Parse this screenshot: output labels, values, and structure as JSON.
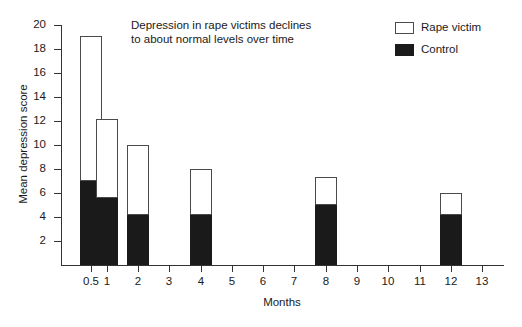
{
  "chart_data": {
    "type": "bar",
    "title": "Depression in rape victims declines to about normal levels over time",
    "title_line1": "Depression in rape victims declines",
    "title_line2": "to about normal levels over time",
    "xlabel": "Months",
    "ylabel": "Mean depression score",
    "stacked": true,
    "grid": false,
    "legend_position": "top-right",
    "xlim": [
      0,
      13
    ],
    "ylim": [
      0,
      20
    ],
    "x_tick_labels": [
      "0.5",
      "1",
      "2",
      "3",
      "4",
      "5",
      "6",
      "7",
      "8",
      "9",
      "10",
      "11",
      "12",
      "13"
    ],
    "x_tick_values": [
      0.5,
      1,
      2,
      3,
      4,
      5,
      6,
      7,
      8,
      9,
      10,
      11,
      12,
      13
    ],
    "y_tick_labels": [
      "2",
      "4",
      "6",
      "8",
      "10",
      "12",
      "14",
      "16",
      "18",
      "20"
    ],
    "y_tick_values": [
      2,
      4,
      6,
      8,
      10,
      12,
      14,
      16,
      18,
      20
    ],
    "categories": [
      "0.5",
      "1",
      "2",
      "4",
      "8",
      "12"
    ],
    "series": [
      {
        "name": "Rape victim",
        "color": "#ffffff",
        "values": [
          19.1,
          12.2,
          10.0,
          8.0,
          7.3,
          6.0
        ]
      },
      {
        "name": "Control",
        "color": "#1a1a1a",
        "values": [
          7.0,
          5.6,
          4.2,
          4.2,
          5.0,
          4.2
        ]
      }
    ],
    "bars": [
      {
        "x": 0.5,
        "total": 19.1,
        "control": 7.0
      },
      {
        "x": 1,
        "total": 12.2,
        "control": 5.6
      },
      {
        "x": 2,
        "total": 10.0,
        "control": 4.2
      },
      {
        "x": 4,
        "total": 8.0,
        "control": 4.2
      },
      {
        "x": 8,
        "total": 7.3,
        "control": 5.0
      },
      {
        "x": 12,
        "total": 6.0,
        "control": 4.2
      }
    ]
  },
  "legend": {
    "items": [
      {
        "label": "Rape victim",
        "swatch": "white"
      },
      {
        "label": "Control",
        "swatch": "black"
      }
    ]
  }
}
